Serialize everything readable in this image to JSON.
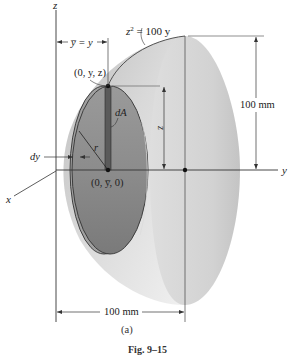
{
  "figure": {
    "caption": "Fig. 9–15",
    "sublabel": "(a)"
  },
  "axes": {
    "z_label": "z",
    "y_label": "y",
    "x_label": "x"
  },
  "labels": {
    "equation_lhs": "z",
    "equation_exp": "2",
    "equation_rhs": " = 100 y",
    "ybar_eq": "y̅ = y",
    "point_top": "(0, y, z)",
    "point_center": "(0, y̅, 0)",
    "dA": "dA",
    "z_strip": "z",
    "r": "r",
    "dy": "dy"
  },
  "dimensions": {
    "height": "100 mm",
    "length": "100 mm"
  },
  "colors": {
    "shell_light": "#e2e2e2",
    "shell_mid": "#c8c8c8",
    "disk_dark": "#8a8a8a",
    "disk_rim": "#a4a4a4",
    "strip": "#5e5e5e",
    "line": "#333333"
  }
}
